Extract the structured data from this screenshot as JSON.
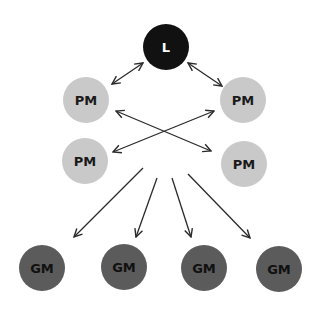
{
  "diagram": {
    "colors": {
      "background": "#ffffff",
      "leader_fill": "#111111",
      "leader_text": "#ffffff",
      "pm_fill": "#c9c9c9",
      "pm_text": "#1a1a1a",
      "gm_fill": "#5b5b5b",
      "gm_text": "#111111",
      "edge": "#2a2a2a"
    },
    "nodes": [
      {
        "id": "L",
        "label": "L",
        "role": "leader",
        "cx": 166,
        "cy": 47,
        "r": 23
      },
      {
        "id": "PM1",
        "label": "PM",
        "role": "pm",
        "cx": 86,
        "cy": 100,
        "r": 23
      },
      {
        "id": "PM2",
        "label": "PM",
        "role": "pm",
        "cx": 243,
        "cy": 100,
        "r": 23
      },
      {
        "id": "PM3",
        "label": "PM",
        "role": "pm",
        "cx": 85,
        "cy": 161,
        "r": 23
      },
      {
        "id": "PM4",
        "label": "PM",
        "role": "pm",
        "cx": 244,
        "cy": 164,
        "r": 23
      },
      {
        "id": "GM1",
        "label": "GM",
        "role": "gm",
        "cx": 42,
        "cy": 268,
        "r": 23
      },
      {
        "id": "GM2",
        "label": "GM",
        "role": "gm",
        "cx": 124,
        "cy": 267,
        "r": 23
      },
      {
        "id": "GM3",
        "label": "GM",
        "role": "gm",
        "cx": 204,
        "cy": 268,
        "r": 23
      },
      {
        "id": "GM4",
        "label": "GM",
        "role": "gm",
        "cx": 279,
        "cy": 269,
        "r": 23
      }
    ],
    "edges": [
      {
        "from": "L",
        "to": "PM1",
        "x1": 143,
        "y1": 63,
        "x2": 112,
        "y2": 84,
        "bidirectional": true
      },
      {
        "from": "L",
        "to": "PM2",
        "x1": 188,
        "y1": 63,
        "x2": 222,
        "y2": 86,
        "bidirectional": true
      },
      {
        "from": "PM1",
        "to": "PM4",
        "x1": 116,
        "y1": 111,
        "x2": 211,
        "y2": 151,
        "bidirectional": true
      },
      {
        "from": "PM2",
        "to": "PM3",
        "x1": 214,
        "y1": 111,
        "x2": 113,
        "y2": 152,
        "bidirectional": true
      },
      {
        "from": "center",
        "to": "GM1",
        "x1": 143,
        "y1": 168,
        "x2": 74,
        "y2": 237,
        "bidirectional": false
      },
      {
        "from": "center",
        "to": "GM2",
        "x1": 157,
        "y1": 178,
        "x2": 136,
        "y2": 237,
        "bidirectional": false
      },
      {
        "from": "center",
        "to": "GM3",
        "x1": 172,
        "y1": 178,
        "x2": 191,
        "y2": 237,
        "bidirectional": false
      },
      {
        "from": "center",
        "to": "GM4",
        "x1": 188,
        "y1": 174,
        "x2": 250,
        "y2": 238,
        "bidirectional": false
      }
    ]
  }
}
